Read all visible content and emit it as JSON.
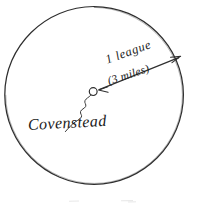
{
  "diagram": {
    "background_color": "#ffffff",
    "ink_color": "#2a2a2a",
    "labels": {
      "distance_primary": "1 league",
      "distance_secondary": "(3 miles)",
      "center_point": "Covenstead"
    },
    "bottom_caption": "",
    "icons": {
      "center_marker": "small-open-circle-icon",
      "radius_arrow": "double-headed-arrow-icon",
      "leader": "squiggle-leader-line-icon",
      "boundary": "hand-drawn-circle-icon"
    },
    "geometry": {
      "circle_center_x": 94,
      "circle_center_y": 95,
      "circle_radius": 89,
      "center_marker_x": 93,
      "center_marker_y": 92,
      "center_marker_radius": 4,
      "arrow_tip_x": 181,
      "arrow_tip_y": 56,
      "radius_label_value": 1,
      "radius_label_unit": "league",
      "radius_equivalent_miles": 3
    }
  }
}
